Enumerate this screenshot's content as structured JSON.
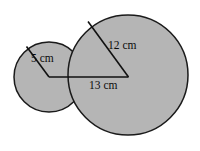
{
  "figure": {
    "background_color": "#ffffff",
    "fill_color": "#b5b5b5",
    "stroke_color": "#1a1a1a",
    "label_color": "#0b0b0b",
    "labels": {
      "small_radius": "5 cm",
      "large_radius": "12 cm",
      "base_segment": "13 cm"
    },
    "label_positions": {
      "small_radius": {
        "x": 31,
        "y": 59
      },
      "large_radius": {
        "x": 108,
        "y": 46
      },
      "base_segment": {
        "x": 89,
        "y": 86
      }
    },
    "shapes": {
      "small_circle": {
        "cx": 49,
        "cy": 77,
        "r": 35,
        "stroke_width": 1.5
      },
      "large_circle": {
        "cx": 128,
        "cy": 75,
        "r": 60,
        "stroke_width": 1.5
      }
    },
    "segments": {
      "small_radius_line": {
        "x1": 49,
        "y1": 77,
        "x2": 26.5,
        "y2": 46.5
      },
      "base_line": {
        "x1": 49,
        "y1": 77,
        "x2": 128.5,
        "y2": 77
      },
      "large_radius_line": {
        "x1": 128.5,
        "y1": 77,
        "x2": 88,
        "y2": 21.5
      }
    }
  }
}
